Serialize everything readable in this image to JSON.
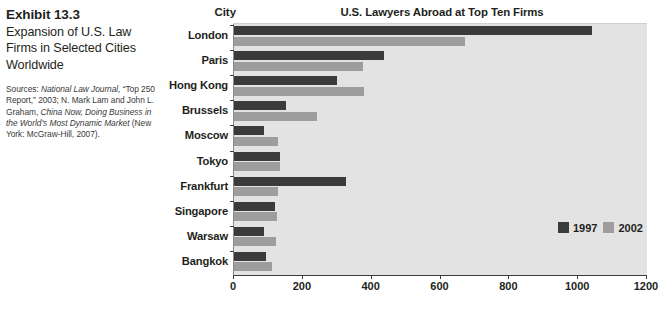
{
  "caption": {
    "exhibit_number": "Exhibit 13.3",
    "exhibit_title": "Expansion of U.S. Law Firms in Selected Cities Worldwide",
    "sources_label": "Sources:",
    "sources_text_1": "National Law Journal,",
    "sources_text_2": "“Top 250 Report,” 2003; N. Mark Lam and John L. Graham,",
    "sources_text_3": "China Now, Doing Business in the World’s Most Dynamic Market",
    "sources_text_4": "(New York: McGraw-Hill, 2007)."
  },
  "chart_data": {
    "type": "bar",
    "orientation": "horizontal",
    "title": "U.S. Lawyers Abroad at Top Ten Firms",
    "xlabel": "",
    "ylabel": "City",
    "categories": [
      "London",
      "Paris",
      "Hong Kong",
      "Brussels",
      "Moscow",
      "Tokyo",
      "Frankfurt",
      "Singapore",
      "Warsaw",
      "Bangkok"
    ],
    "series": [
      {
        "name": "1997",
        "color": "#3b3b3b",
        "values": [
          1040,
          435,
          300,
          150,
          87,
          135,
          325,
          120,
          88,
          93
        ]
      },
      {
        "name": "2002",
        "color": "#9d9d9d",
        "values": [
          670,
          375,
          378,
          240,
          128,
          135,
          128,
          125,
          122,
          110
        ]
      }
    ],
    "xlim": [
      0,
      1200
    ],
    "xticks": [
      0,
      200,
      400,
      600,
      800,
      1000,
      1200
    ],
    "xtick_labels": [
      "0",
      "200",
      "400",
      "600",
      "800",
      "1000",
      "1200"
    ],
    "grid": false,
    "legend_position": "inside-bottom-right",
    "plot_background": "#e3e3e3"
  }
}
